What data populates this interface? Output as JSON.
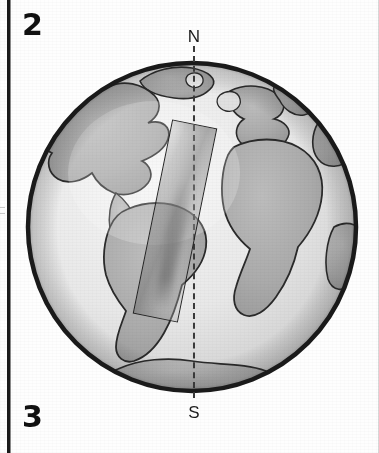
{
  "figure": {
    "type": "diagram",
    "panel_number_top": "2",
    "panel_number_bottom": "3",
    "background_color": "#fefefe",
    "ink_color": "#1a1a1a"
  },
  "labels": {
    "north_pole": "N",
    "south_pole": "S"
  },
  "globe": {
    "center_x": 192,
    "center_y": 227,
    "radius": 170,
    "outline_color": "#1a1a1a",
    "ocean_color": "#ebebeb",
    "land_color": "#b0b0b0",
    "land_outline_color": "#2a2a2a",
    "landmasses": [
      "North America",
      "South America",
      "Greenland",
      "Africa",
      "Europe",
      "Antarctica"
    ]
  },
  "axis": {
    "name": "rotation-axis",
    "style": "dashed",
    "orientation": "vertical",
    "color": "#3a3a3a",
    "from_label": "N",
    "to_label": "S"
  },
  "overlay_bar": {
    "name": "tilted-bar",
    "shape": "rectangle",
    "rotation_degrees": 11.5,
    "fill": "gray-gradient",
    "stroke_color": "#232323"
  },
  "frame": {
    "left_rule_color": "#1a1a1a",
    "right_rule_color": "#d8d8d8"
  }
}
